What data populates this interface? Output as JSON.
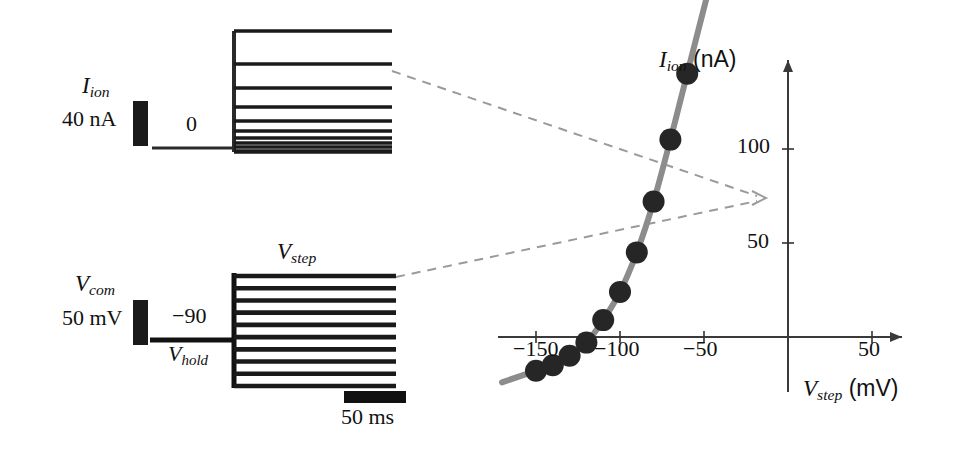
{
  "figure": {
    "colors": {
      "trace": "#1a1a1a",
      "curve": "#8c8c8c",
      "marker": "#262626",
      "axis": "#333333",
      "dashed": "#9a9a9a",
      "background": "#ffffff"
    }
  },
  "current_panel": {
    "signal_label": "I",
    "signal_sub": "ion",
    "scale_value": "40 nA",
    "baseline_label": "0",
    "trace_count": 10,
    "description": "Family of ionic current traces evoked by voltage steps"
  },
  "voltage_panel": {
    "signal_label": "V",
    "signal_sub": "com",
    "scale_value": "50 mV",
    "holding_value": "−90",
    "holding_label": "V",
    "holding_sub": "hold",
    "step_label": "V",
    "step_sub": "step",
    "time_scale": "50 ms",
    "trace_count": 10,
    "description": "Family of command voltage steps from holding potential"
  },
  "chart_data": {
    "type": "line",
    "title": "",
    "xlabel": "V_step (mV)",
    "ylabel": "I_ion (nA)",
    "xlabel_symbol": "V",
    "xlabel_sub": "step",
    "xlabel_unit": "(mV)",
    "ylabel_symbol": "I",
    "ylabel_sub": "ion",
    "ylabel_unit": "(nA)",
    "xlim": [
      -165,
      60
    ],
    "ylim": [
      -30,
      165
    ],
    "xticks": [
      -150,
      -100,
      -50,
      50
    ],
    "xtick_labels": [
      "−150",
      "−100",
      "−50",
      "50"
    ],
    "yticks": [
      50,
      100
    ],
    "ytick_labels": [
      "50",
      "100"
    ],
    "grid": false,
    "legend": false,
    "x": [
      -150,
      -140,
      -130,
      -120,
      -110,
      -100,
      -90,
      -80,
      -70,
      -60
    ],
    "y": [
      -18,
      -15,
      -10,
      -3,
      9,
      24,
      45,
      72,
      105,
      140
    ],
    "marker": "filled-circle",
    "marker_count": 10,
    "series": [
      {
        "name": "steady-state I-V",
        "x": [
          -150,
          -140,
          -130,
          -120,
          -110,
          -100,
          -90,
          -80,
          -70,
          -60
        ],
        "values": [
          -18,
          -15,
          -10,
          -3,
          9,
          24,
          45,
          72,
          105,
          140
        ]
      }
    ]
  },
  "annotations": {
    "connector_1": "dashed arrow from current trace family to I-V data point",
    "connector_2": "dashed arrow from voltage step family to I-V data point",
    "arrow_target_x": -30,
    "arrow_target_y": 75
  }
}
